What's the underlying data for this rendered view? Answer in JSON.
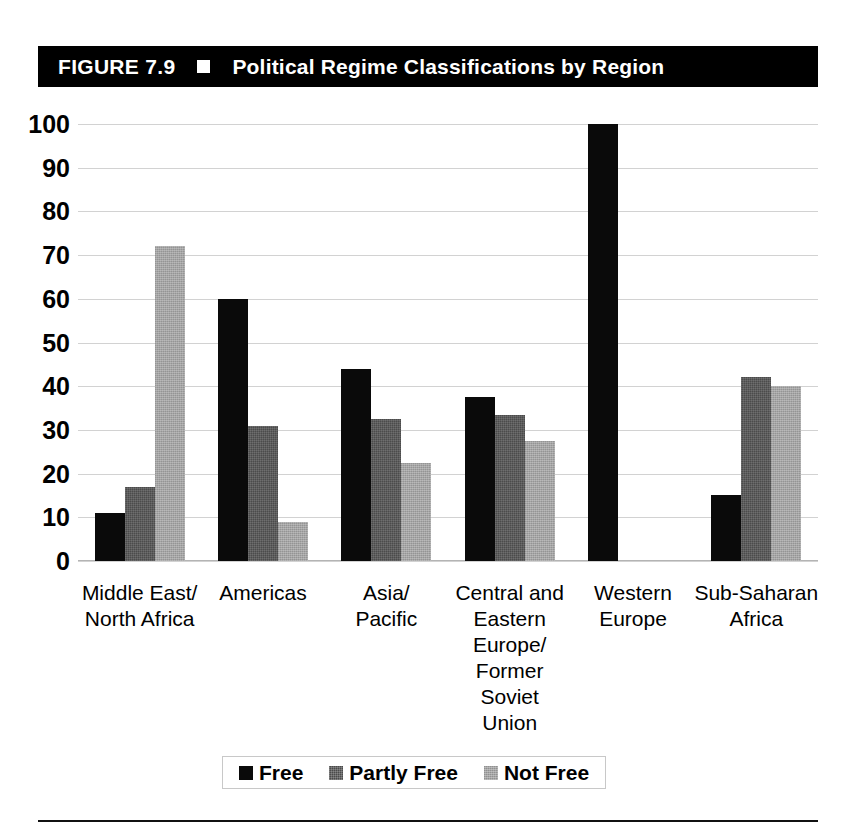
{
  "figure": {
    "number_label": "FIGURE 7.9",
    "marker_icon": "white-square-icon",
    "title": "Political Regime Classifications by Region"
  },
  "chart_data": {
    "type": "bar",
    "title": "Political Regime Classifications by Region",
    "xlabel": "",
    "ylabel": "",
    "ylim": [
      0,
      100
    ],
    "yticks": [
      0,
      10,
      20,
      30,
      40,
      50,
      60,
      70,
      80,
      90,
      100
    ],
    "ytick_labels": [
      "0",
      "10",
      "20",
      "30",
      "40",
      "50",
      "60",
      "70",
      "80",
      "90",
      "100"
    ],
    "grid": true,
    "legend_position": "bottom",
    "categories": [
      "Middle East/\nNorth Africa",
      "Americas",
      "Asia/\nPacific",
      "Central and\nEastern\nEurope/\nFormer\nSoviet\nUnion",
      "Western\nEurope",
      "Sub-Saharan\nAfrica"
    ],
    "series": [
      {
        "name": "Free",
        "color": "#0a0a0a",
        "values": [
          11,
          60,
          44,
          37.5,
          100,
          15
        ]
      },
      {
        "name": "Partly Free",
        "color": "#4b4b4b",
        "values": [
          17,
          31,
          32.5,
          33.5,
          0,
          42
        ]
      },
      {
        "name": "Not Free",
        "color": "#a5a5a5",
        "values": [
          72,
          9,
          22.5,
          27.5,
          0,
          40
        ]
      }
    ]
  },
  "legend": {
    "items": [
      {
        "label": "Free",
        "swatch": "black-square-swatch"
      },
      {
        "label": "Partly Free",
        "swatch": "dark-gray-square-swatch"
      },
      {
        "label": "Not Free",
        "swatch": "light-gray-square-swatch"
      }
    ]
  }
}
